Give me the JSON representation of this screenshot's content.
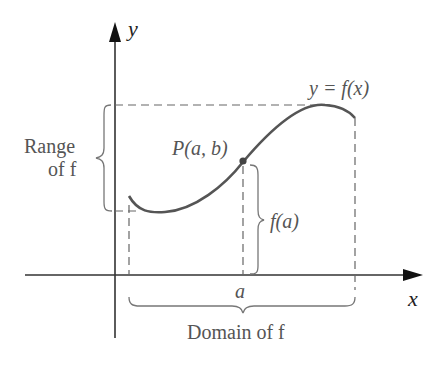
{
  "diagram": {
    "axis_labels": {
      "x": "x",
      "y": "y"
    },
    "function_label": "y = f(x)",
    "point_label": "P(a, b)",
    "value_label": "f(a)",
    "x_tick_label": "a",
    "range_label_line1": "Range",
    "range_label_line2": "of f",
    "domain_label": "Domain of f"
  }
}
